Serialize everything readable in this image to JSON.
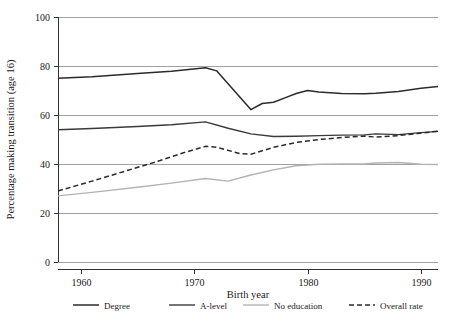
{
  "chart_data": {
    "type": "line",
    "title": "",
    "subtitle": "",
    "xlabel": "Birth year",
    "ylabel": "Percentage making transition (age 16)",
    "xlim": [
      1958,
      1991.5
    ],
    "ylim": [
      0,
      100
    ],
    "xticks": [
      1960,
      1970,
      1980,
      1990
    ],
    "xtick_labels": [
      "1960",
      "1970",
      "1980",
      "1990"
    ],
    "yticks": [
      0,
      20,
      40,
      60,
      80,
      100
    ],
    "ytick_labels": [
      "0",
      "20",
      "40",
      "60",
      "80",
      "100"
    ],
    "grid": true,
    "grid_axis": "y",
    "legend_position": "bottom",
    "series": [
      {
        "name": "Degree",
        "style": "solid",
        "color": "#2b2b2b",
        "width": 1.5,
        "x": [
          1958,
          1961,
          1965,
          1968,
          1971,
          1972,
          1975,
          1976,
          1977,
          1978,
          1979,
          1980,
          1981,
          1983,
          1985,
          1986,
          1988,
          1990,
          1991.5
        ],
        "values": [
          75.0,
          75.6,
          76.9,
          77.9,
          79.3,
          78.0,
          62.2,
          64.7,
          65.2,
          67.0,
          68.8,
          70.0,
          69.4,
          68.8,
          68.7,
          68.9,
          69.6,
          70.9,
          71.6
        ]
      },
      {
        "name": "A-level",
        "style": "solid",
        "color": "#3a3a3a",
        "width": 1.4,
        "x": [
          1958,
          1961,
          1965,
          1968,
          1971,
          1973,
          1975,
          1977,
          1979,
          1981,
          1983,
          1985,
          1986,
          1988,
          1990,
          1991.5
        ],
        "values": [
          54.0,
          54.5,
          55.3,
          56.0,
          57.2,
          54.6,
          52.3,
          51.2,
          51.3,
          51.6,
          51.8,
          51.9,
          52.3,
          52.0,
          52.8,
          53.3
        ]
      },
      {
        "name": "No education",
        "style": "solid",
        "color": "#b3b3b3",
        "width": 1.4,
        "x": [
          1958,
          1961,
          1965,
          1968,
          1971,
          1973,
          1975,
          1977,
          1979,
          1981,
          1983,
          1985,
          1986,
          1988,
          1990,
          1991.5
        ],
        "values": [
          27.0,
          28.4,
          30.5,
          32.2,
          34.1,
          33.0,
          35.5,
          37.6,
          39.3,
          39.9,
          40.0,
          40.0,
          40.4,
          40.6,
          39.9,
          39.8
        ]
      },
      {
        "name": "Overall rate",
        "style": "dashed",
        "color": "#2b2b2b",
        "width": 1.5,
        "x": [
          1958,
          1961,
          1964,
          1967,
          1969,
          1971,
          1972,
          1974,
          1975,
          1977,
          1979,
          1981,
          1983,
          1985,
          1986,
          1988,
          1990,
          1991.5
        ],
        "values": [
          29.0,
          33.0,
          37.2,
          41.4,
          44.5,
          47.2,
          46.8,
          44.3,
          44.0,
          46.8,
          48.8,
          50.0,
          50.8,
          51.4,
          51.0,
          51.6,
          52.6,
          53.4
        ]
      }
    ]
  },
  "legend": {
    "items": [
      {
        "label": "Degree"
      },
      {
        "label": "A-level"
      },
      {
        "label": "No education"
      },
      {
        "label": "Overall rate"
      }
    ]
  }
}
